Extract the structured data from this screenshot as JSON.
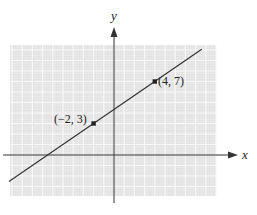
{
  "chart_data": {
    "type": "line",
    "title": "",
    "xlabel": "x",
    "ylabel": "y",
    "grid": true,
    "points": [
      {
        "x": -2,
        "y": 3,
        "label": "(−2, 3)"
      },
      {
        "x": 4,
        "y": 7,
        "label": "(4, 7)"
      }
    ],
    "line": {
      "slope": 0.6667,
      "intercept": 4.3333,
      "x_range": [
        -10.3,
        8.6
      ]
    },
    "xlim": [
      -10.4,
      10.1
    ],
    "ylim": [
      -4.0,
      10.3
    ]
  },
  "labels": {
    "x_axis": "x",
    "y_axis": "y",
    "point_a": "(−2, 3)",
    "point_b": "(4, 7)"
  },
  "colors": {
    "grid_bg": "#e6e6e6",
    "grid_line": "#f8f8f8",
    "axis": "#333333",
    "line": "#333333",
    "point": "#222222"
  }
}
